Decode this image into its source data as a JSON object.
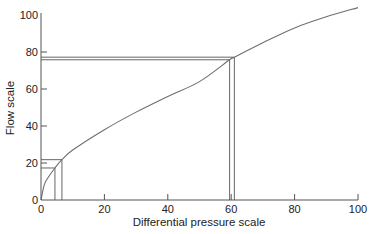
{
  "chart_data": {
    "type": "line",
    "title": "",
    "xlabel": "Differential pressure scale",
    "ylabel": "Flow scale",
    "xlim": [
      0,
      100
    ],
    "ylim": [
      0,
      100
    ],
    "x_ticks": [
      0,
      20,
      40,
      60,
      80,
      100
    ],
    "y_ticks": [
      0,
      20,
      40,
      60,
      80,
      100
    ],
    "x_tick_labels": [
      "0",
      "20",
      "40",
      "60",
      "80",
      "100"
    ],
    "y_tick_labels": [
      "0",
      "20",
      "40",
      "60",
      "80",
      "100"
    ],
    "grid": false,
    "legend": null,
    "series": [
      {
        "name": "Flow vs differential pressure",
        "x": [
          0,
          1,
          2,
          4.4,
          6.6,
          10,
          20,
          30,
          40,
          50,
          59.5,
          61,
          70,
          80,
          90,
          100
        ],
        "y": [
          0,
          8,
          11.5,
          17.3,
          21.8,
          27,
          38,
          47.5,
          56,
          64,
          75.8,
          77.2,
          85,
          93,
          99,
          104
        ]
      }
    ],
    "annotations": [
      {
        "type": "reference-box",
        "x": 4.4,
        "y": 17.3
      },
      {
        "type": "reference-box",
        "x": 6.6,
        "y": 21.8
      },
      {
        "type": "reference-box",
        "x": 59.5,
        "y": 75.8
      },
      {
        "type": "reference-box",
        "x": 61,
        "y": 77.2
      }
    ],
    "colors": {
      "curve": "#6e6e6e",
      "axes": "#555555",
      "text": "#222222"
    }
  }
}
